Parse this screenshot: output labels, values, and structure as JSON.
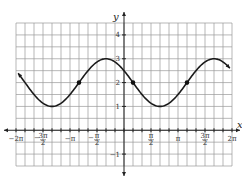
{
  "chart_data": {
    "type": "line",
    "title": "",
    "function": "y = 2 + cos(x + pi/3)",
    "xlabel": "x",
    "ylabel": "y",
    "xlim_pi": [
      -2,
      2
    ],
    "ylim": [
      -1.5,
      4.5
    ],
    "grid": true,
    "x_grid_step_pi": 0.1666667,
    "y_grid_step": 0.5,
    "x_tick_labels": [
      {
        "pos_pi": -2,
        "label": "−2π"
      },
      {
        "pos_pi": -1.5,
        "label": "−3π/2"
      },
      {
        "pos_pi": -1,
        "label": "−π"
      },
      {
        "pos_pi": -0.5,
        "label": "−π/2"
      },
      {
        "pos_pi": 0.5,
        "label": "π/2"
      },
      {
        "pos_pi": 1,
        "label": "π"
      },
      {
        "pos_pi": 1.5,
        "label": "3π/2"
      },
      {
        "pos_pi": 2,
        "label": "2π"
      }
    ],
    "y_tick_labels": [
      {
        "pos": 4,
        "label": "4"
      },
      {
        "pos": 3,
        "label": "3"
      },
      {
        "pos": 2,
        "label": "2"
      },
      {
        "pos": 1,
        "label": "1"
      },
      {
        "pos": -1,
        "label": "−1"
      }
    ],
    "series": [
      {
        "name": "y = 2 + cos(x + π/3)",
        "x_pi": [
          -2,
          -1.8333,
          -1.6667,
          -1.5,
          -1.3333,
          -1.1667,
          -1,
          -0.8333,
          -0.6667,
          -0.5,
          -0.3333,
          -0.1667,
          0,
          0.1667,
          0.3333,
          0.5,
          0.6667,
          0.8333,
          1,
          1.1667,
          1.3333,
          1.5,
          1.6667,
          1.8333,
          2
        ],
        "y": [
          2.5,
          2.0,
          1.5,
          1.134,
          1.0,
          1.134,
          1.5,
          2.0,
          2.5,
          2.866,
          3.0,
          2.866,
          2.5,
          2.0,
          1.5,
          1.134,
          1.0,
          1.134,
          1.5,
          2.0,
          2.5,
          2.866,
          3.0,
          2.866,
          2.5
        ],
        "arrows_at_ends": true
      }
    ],
    "marked_points": [
      {
        "x_pi": -0.8333,
        "y": 2
      },
      {
        "x_pi": 0.1667,
        "y": 2
      },
      {
        "x_pi": 1.1667,
        "y": 2
      }
    ],
    "colors": {
      "curve": "#1a1a1a",
      "grid": "#9a9a9a",
      "axis": "#222222"
    }
  },
  "axes": {
    "x_label": "x",
    "y_label": "y"
  }
}
